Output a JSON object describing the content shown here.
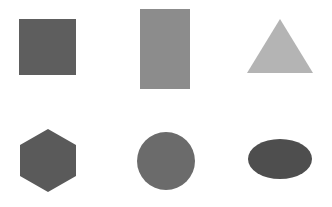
{
  "canvas": {
    "width": 332,
    "height": 207,
    "background": "#ffffff"
  },
  "shapes": [
    {
      "type": "square",
      "color": "#5e5e5e",
      "x": 19,
      "y": 19,
      "w": 57,
      "h": 56
    },
    {
      "type": "rectangle",
      "color": "#8c8c8c",
      "x": 140,
      "y": 9,
      "w": 50,
      "h": 80
    },
    {
      "type": "triangle",
      "color": "#b4b4b4",
      "points": "280,19 247,73 313,73"
    },
    {
      "type": "hexagon",
      "color": "#5a5a5a",
      "points": "48,129 76,145 76,176 48,192 20,176 20,145"
    },
    {
      "type": "circle",
      "color": "#6b6b6b",
      "cx": 166,
      "cy": 161,
      "r": 29
    },
    {
      "type": "ellipse",
      "color": "#4e4e4e",
      "cx": 280,
      "cy": 159,
      "rx": 32,
      "ry": 20
    }
  ]
}
